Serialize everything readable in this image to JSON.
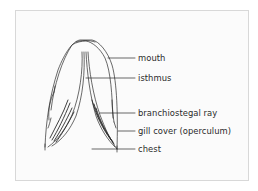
{
  "diagram": {
    "stroke_color": "#2a2a2a",
    "frame_border_color": "#d8d8d8",
    "labels": [
      {
        "id": "mouth",
        "text": "mouth"
      },
      {
        "id": "isthmus",
        "text": "isthmus"
      },
      {
        "id": "branchiostegal-ray",
        "text": "branchiostegal ray"
      },
      {
        "id": "gill-cover",
        "text": "gill cover (operculum)"
      },
      {
        "id": "chest",
        "text": "chest"
      }
    ]
  }
}
